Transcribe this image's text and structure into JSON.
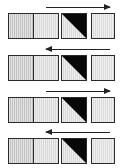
{
  "figure": {
    "title": "",
    "width": 123,
    "height": 168,
    "background": "#ffffff",
    "row_count": 4
  },
  "palette": {
    "black": "#080808",
    "border": "#2b2b2b",
    "gray_dark": "#c2c2c2",
    "gray_mid": "#d0d0d0",
    "gray_light": "#d9d9d9",
    "gray_lighter": "#dcdcdc",
    "arrow": "#222222",
    "background": "#ffffff"
  },
  "rows": [
    {
      "index": 1,
      "arrow": {
        "name": "arrow-right",
        "direction": "right",
        "glyph": "→"
      },
      "pair": {
        "name": "pair-block",
        "left_cell": {
          "name": "cell-left",
          "fill": "gray-dark",
          "pattern": "vertical-hatch"
        },
        "right_cell": {
          "name": "cell-right",
          "fill": "gray-light",
          "pattern": "vertical-hatch"
        }
      },
      "split_cell": {
        "name": "split-cell",
        "diagonal": "top-left-to-bottom-right",
        "upper_fill": "black",
        "lower_fill": "gray-light"
      },
      "single_cell": {
        "name": "single-cell",
        "fill": "gray-lighter",
        "pattern": "vertical-hatch"
      }
    },
    {
      "index": 2,
      "arrow": {
        "name": "arrow-left",
        "direction": "left",
        "glyph": "←"
      },
      "pair": {
        "name": "pair-block",
        "left_cell": {
          "name": "cell-left",
          "fill": "gray-dark",
          "pattern": "vertical-hatch"
        },
        "right_cell": {
          "name": "cell-right",
          "fill": "gray-light",
          "pattern": "vertical-hatch"
        }
      },
      "split_cell": {
        "name": "split-cell",
        "diagonal": "top-left-to-bottom-right",
        "upper_fill": "black",
        "lower_fill": "gray-light"
      },
      "single_cell": {
        "name": "single-cell",
        "fill": "gray-lighter",
        "pattern": "vertical-hatch"
      }
    },
    {
      "index": 3,
      "arrow": {
        "name": "arrow-right",
        "direction": "right",
        "glyph": "→"
      },
      "pair": {
        "name": "pair-block",
        "left_cell": {
          "name": "cell-left",
          "fill": "gray-dark",
          "pattern": "vertical-hatch"
        },
        "right_cell": {
          "name": "cell-right",
          "fill": "gray-light",
          "pattern": "vertical-hatch"
        }
      },
      "split_cell": {
        "name": "split-cell",
        "diagonal": "top-left-to-bottom-right",
        "upper_fill": "black",
        "lower_fill": "gray-light"
      },
      "single_cell": {
        "name": "single-cell",
        "fill": "gray-lighter",
        "pattern": "vertical-hatch"
      }
    },
    {
      "index": 4,
      "arrow": {
        "name": "arrow-left",
        "direction": "left",
        "glyph": "←"
      },
      "pair": {
        "name": "pair-block",
        "left_cell": {
          "name": "cell-left",
          "fill": "gray-dark",
          "pattern": "vertical-hatch"
        },
        "right_cell": {
          "name": "cell-right",
          "fill": "gray-light",
          "pattern": "vertical-hatch"
        }
      },
      "split_cell": {
        "name": "split-cell",
        "diagonal": "top-left-to-bottom-right",
        "upper_fill": "black",
        "lower_fill": "gray-light"
      },
      "single_cell": {
        "name": "single-cell",
        "fill": "gray-lighter",
        "pattern": "vertical-hatch"
      }
    }
  ]
}
